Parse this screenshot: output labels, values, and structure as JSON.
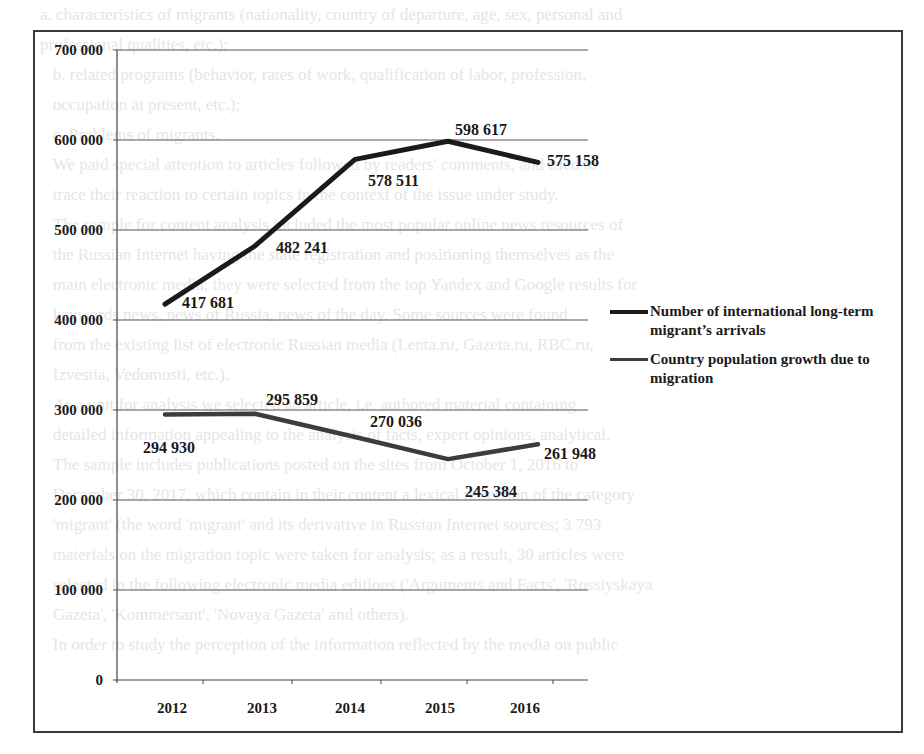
{
  "chart_data": {
    "type": "line",
    "title": "",
    "xlabel": "",
    "ylabel": "",
    "x": [
      "2012",
      "2013",
      "2014",
      "2015",
      "2016"
    ],
    "ylim": [
      0,
      700000
    ],
    "yticks": [
      "0",
      "100 000",
      "200 000",
      "300 000",
      "400 000",
      "500 000",
      "600 000",
      "700 000"
    ],
    "grid": true,
    "legend_position": "right",
    "series": [
      {
        "name": "Number of international long-term migrant's arrivals",
        "values": [
          417681,
          482241,
          578511,
          598617,
          575158
        ],
        "labels": [
          "417 681",
          "482 241",
          "578 511",
          "598 617",
          "575 158"
        ],
        "color": "#1a1a1a"
      },
      {
        "name": "Country population growth due to migration",
        "values": [
          294930,
          295859,
          270036,
          245384,
          261948
        ],
        "labels": [
          "294 930",
          "295 859",
          "270 036",
          "245 384",
          "261 948"
        ],
        "color": "#3c3c3c"
      }
    ]
  },
  "legend": {
    "items": [
      {
        "label": "Number of international long-term migrant’s arrivals",
        "color": "#1a1a1a"
      },
      {
        "label": "Country population growth due to migration",
        "color": "#3c3c3c"
      }
    ]
  },
  "axis": {
    "y_ticks": [
      "700 000",
      "600 000",
      "500 000",
      "400 000",
      "300 000",
      "200 000",
      "100 000",
      "0"
    ],
    "x_ticks": [
      "2012",
      "2013",
      "2014",
      "2015",
      "2016"
    ]
  },
  "labels": {
    "s1": [
      "417 681",
      "482 241",
      "578 511",
      "598 617",
      "575 158"
    ],
    "s2": [
      "294 930",
      "295 859",
      "270 036",
      "245 384",
      "261 948"
    ]
  },
  "background_text": "a. characteristics of migrants (nationality, country of departure, age, sex, personal and\nprofessional qualities, etc.);\n   b. related programs (behavior, rates of work, qualification of labor, profession,\n   occupation at present, etc.);\n   c. Problems of migrants.\n   We paid special attention to articles followed by readers' comments, and tried to\n   trace their reaction to certain topics in the context of the issue under study.\n   The sample for content analysis included the most popular online news resources of\n   the Russian Internet having the state registration and positioning themselves as the\n   main electronic media; they were selected from the top Yandex and Google results for\n   keywords news, news of Russia, news of the day. Some sources were found\n   from the existing list of electronic Russian media (Lenta.ru, Gazeta.ru, RBC.ru,\n   Izvestia, Vedomosti, etc.).\n   As a unit for analysis we selected an article, i.e. authored material containing\n   detailed information appealing to the analysis of facts, expert opinions, analytical.\n   The sample includes publications posted on the sites from October 1, 2016 to\n   December 30, 2017, which contain in their content a lexical reflection of the category\n   'migrant' (the word 'migrant' and its derivative in Russian Internet sources; 3 793\n   materials on the migration topic were taken for analysis; as a result, 30 articles were\n   selected in the following electronic media editions ('Arguments and Facts', 'Rossiyskaya\n   Gazeta', 'Kommersant', 'Novaya Gazeta' and others).\n   In order to study the perception of the information reflected by the media on public"
}
